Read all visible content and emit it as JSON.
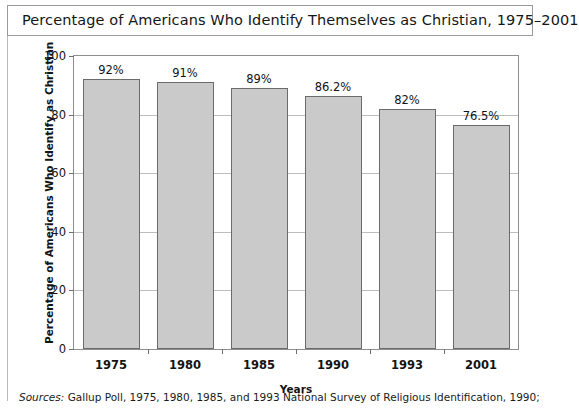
{
  "figure": {
    "title": "Percentage of Americans Who Identify Themselves as Christian, 1975–2001",
    "source_label": "Sources:",
    "source_text": " Gallup Poll, 1975, 1980, 1985, and 1993 National Survey of Religious Identification, 1990;"
  },
  "chart_data": {
    "type": "bar",
    "title": "Percentage of Americans Who Identify Themselves as Christian, 1975–2001",
    "xlabel": "Years",
    "ylabel": "Percentage of Americans Who Identify as Christian",
    "categories": [
      "1975",
      "1980",
      "1985",
      "1990",
      "1993",
      "2001"
    ],
    "values": [
      92,
      91,
      89,
      86.2,
      82,
      76.5
    ],
    "data_labels": [
      "92%",
      "91%",
      "89%",
      "86.2%",
      "82%",
      "76.5%"
    ],
    "ylim": [
      0,
      100
    ],
    "yticks": [
      0,
      20,
      40,
      60,
      80,
      100
    ],
    "ytick_labels": [
      "0",
      "20",
      "40",
      "60",
      "80",
      "100"
    ],
    "grid": true,
    "legend": null,
    "bar_color": "#cacaca",
    "bar_edge_color": "#6b6b6b"
  }
}
